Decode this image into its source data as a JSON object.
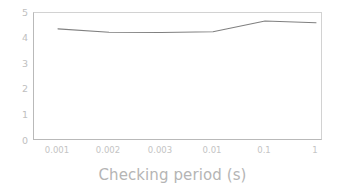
{
  "chart_data": {
    "type": "line",
    "title": "",
    "subtitle": "",
    "xlabel": "Checking period (s)",
    "ylabel": "",
    "categories": [
      "0.001",
      "0.002",
      "0.003",
      "0.01",
      "0.1",
      "1"
    ],
    "values": [
      4.38,
      4.25,
      4.24,
      4.27,
      4.69,
      4.62
    ],
    "series": [
      {
        "name": "",
        "values": [
          4.38,
          4.25,
          4.24,
          4.27,
          4.69,
          4.62
        ]
      }
    ],
    "ylim": [
      0,
      5
    ],
    "yticks": [
      "0",
      "1",
      "2",
      "3",
      "4",
      "5"
    ],
    "xticks": [
      "0.001",
      "0.002",
      "0.003",
      "0.01",
      "0.1",
      "1"
    ],
    "grid": false,
    "legend": false,
    "legend_position": "none",
    "markers": false,
    "line_color": "#808080",
    "axis_color": "#b9b9b9",
    "tick_label_color": "#c0c0c0",
    "axis_title_color": "#b5b5b5",
    "background_color": "#ffffff"
  }
}
